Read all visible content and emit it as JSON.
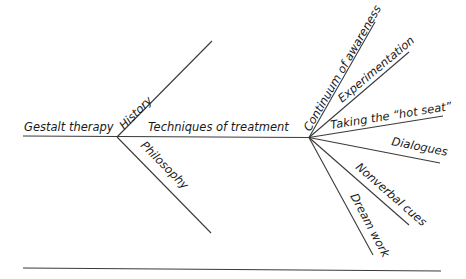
{
  "diagram": {
    "type": "fishbone",
    "main_label": "Gestalt therapy",
    "branches": [
      {
        "label": "History"
      },
      {
        "label": "Philosophy"
      },
      {
        "label": "Techniques of treatment",
        "sub_branches": [
          {
            "label": "Continuum of awareness"
          },
          {
            "label": "Experimentation"
          },
          {
            "label": "Taking the “hot seat”"
          },
          {
            "label": "Dialogues"
          },
          {
            "label": "Nonverbal cues"
          },
          {
            "label": "Dream work"
          }
        ]
      }
    ]
  },
  "colors": {
    "line": "#3a3a3a",
    "text": "#1a1a1a",
    "background": "#ffffff"
  }
}
